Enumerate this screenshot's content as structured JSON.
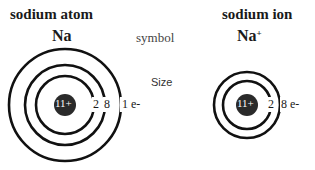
{
  "atom": {
    "title": "sodium atom",
    "symbol": "Na",
    "nucleus": "11+",
    "shell_labels": [
      "2",
      "8",
      "1 e-"
    ]
  },
  "ion": {
    "title": "sodium ion",
    "symbol": "Na",
    "charge": "+",
    "nucleus": "11+",
    "shell_labels": [
      "2",
      "8 e-"
    ]
  },
  "middle": {
    "symbol_label": "symbol",
    "size_label": "Size"
  },
  "colors": {
    "ring": "#111111",
    "nucleus": "#2a2a2a",
    "nucleus_text": "#ffffff"
  }
}
